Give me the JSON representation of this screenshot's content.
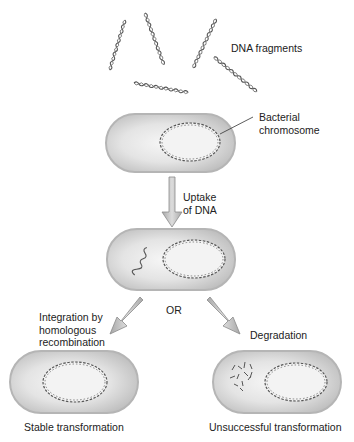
{
  "diagram": {
    "type": "bacterial-transformation",
    "labels": {
      "dna_fragments": "DNA fragments",
      "bacterial_chromosome": [
        "Bacterial",
        "chromosome"
      ],
      "uptake": [
        "Uptake",
        "of DNA"
      ],
      "or": "OR",
      "integration": [
        "Integration by",
        "homologous",
        "recombination"
      ],
      "degradation": "Degradation",
      "stable": "Stable transformation",
      "unsuccessful": "Unsuccessful transformation"
    },
    "stages": [
      {
        "id": "dna-fragments",
        "description": "Five free DNA fragments"
      },
      {
        "id": "cell-initial",
        "description": "Bacterium with circular chromosome"
      },
      {
        "id": "cell-uptake",
        "description": "Bacterium with taken-up DNA fragment"
      },
      {
        "id": "cell-stable",
        "description": "Fragment integrated into chromosome"
      },
      {
        "id": "cell-degraded",
        "description": "Fragment degraded into pieces"
      }
    ],
    "colors": {
      "cell_fill": "#d9d9d9",
      "cell_highlight": "#f4f4f4",
      "cell_border": "#b8b8b8",
      "dna": "#555555",
      "arrow_fill": "#bdbdbd",
      "arrow_stroke": "#8a8a8a"
    }
  }
}
